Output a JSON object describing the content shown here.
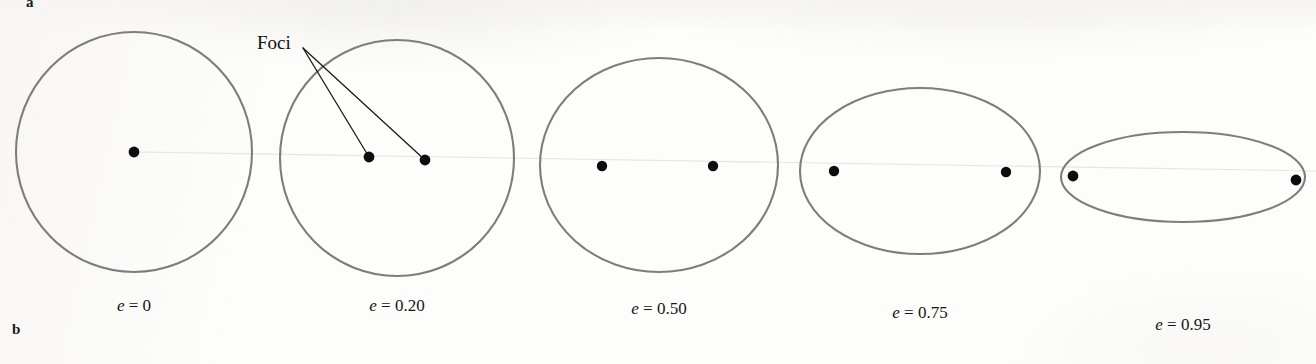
{
  "figure": {
    "panels": [
      {
        "letter": "a"
      },
      {
        "letter": "b"
      }
    ],
    "annotation": {
      "foci_label": "Foci",
      "foci_label_x": 257,
      "foci_label_y": 33,
      "leader_origin_x": 303,
      "leader_origin_y": 48,
      "leader_targets": [
        {
          "x": 369,
          "y": 157
        },
        {
          "x": 425,
          "y": 160
        }
      ]
    },
    "style": {
      "outline_color": "#7d7d7d",
      "outline_width": 2.1,
      "focus_color": "#0d0d0d",
      "leader_color": "#1a1a1a",
      "background_color": "#fdfdfb",
      "scan_line_color": "#e3e1e0",
      "label_color": "#151515"
    },
    "scan_artifact": {
      "x1": 140,
      "y1": 152,
      "x2": 1316,
      "y2": 171
    }
  },
  "chart_data": {
    "type": "diagram",
    "subtitle": "Ellipses of increasing eccentricity with marked foci",
    "xlabel": "",
    "ylabel": "",
    "series_label": "eccentricity",
    "categories": [
      "e = 0",
      "e = 0.20",
      "e = 0.50",
      "e = 0.75",
      "e = 0.95"
    ],
    "values": [
      0,
      0.2,
      0.5,
      0.75,
      0.95
    ],
    "ellipses": [
      {
        "id": "ellipse-e-000",
        "eccentricity": 0,
        "label_prefix": "e",
        "label_eq": " = ",
        "label_value": "0",
        "cx": 134,
        "cy": 152,
        "rx": 118,
        "ry": 120,
        "label_x": 134,
        "label_y": 305,
        "foci": [
          {
            "x": 134,
            "y": 152
          }
        ],
        "focus_radius": 5.4
      },
      {
        "id": "ellipse-e-020",
        "eccentricity": 0.2,
        "label_prefix": "e",
        "label_eq": " = ",
        "label_value": "0.20",
        "cx": 397,
        "cy": 158,
        "rx": 117,
        "ry": 118,
        "label_x": 397,
        "label_y": 305,
        "foci": [
          {
            "x": 369,
            "y": 157
          },
          {
            "x": 425,
            "y": 160
          }
        ],
        "focus_radius": 5.4
      },
      {
        "id": "ellipse-e-050",
        "eccentricity": 0.5,
        "label_prefix": "e",
        "label_eq": " = ",
        "label_value": "0.50",
        "cx": 659,
        "cy": 165,
        "rx": 119,
        "ry": 107,
        "label_x": 659,
        "label_y": 308,
        "foci": [
          {
            "x": 602,
            "y": 166
          },
          {
            "x": 713,
            "y": 166
          }
        ],
        "focus_radius": 5.2
      },
      {
        "id": "ellipse-e-075",
        "eccentricity": 0.75,
        "label_prefix": "e",
        "label_eq": " = ",
        "label_value": "0.75",
        "cx": 920,
        "cy": 171,
        "rx": 120,
        "ry": 83,
        "label_x": 920,
        "label_y": 312,
        "foci": [
          {
            "x": 834,
            "y": 171
          },
          {
            "x": 1006,
            "y": 172
          }
        ],
        "focus_radius": 5.2
      },
      {
        "id": "ellipse-e-095",
        "eccentricity": 0.95,
        "label_prefix": "e",
        "label_eq": " = ",
        "label_value": "0.95",
        "cx": 1183,
        "cy": 177,
        "rx": 122,
        "ry": 45,
        "label_x": 1183,
        "label_y": 324,
        "foci": [
          {
            "x": 1073,
            "y": 176
          },
          {
            "x": 1296,
            "y": 180
          }
        ],
        "focus_radius": 5.4
      }
    ],
    "grid": false,
    "legend": "none"
  }
}
